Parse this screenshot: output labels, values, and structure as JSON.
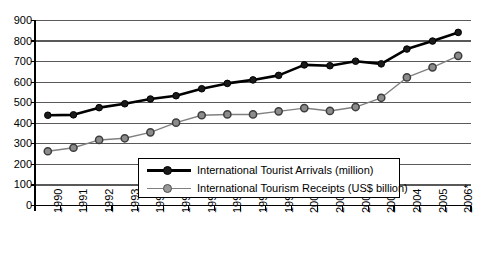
{
  "chart_data": {
    "type": "line",
    "title": "",
    "subtitle": "",
    "xlabel": "",
    "ylabel": "",
    "categories": [
      "1990",
      "1991",
      "1992",
      "1993",
      "1994",
      "1995",
      "1996",
      "1997",
      "1998",
      "1999",
      "2000",
      "2001",
      "2002",
      "2003",
      "2004",
      "2005",
      "2006*"
    ],
    "ylim": [
      0,
      900
    ],
    "yticks": [
      0,
      100,
      200,
      300,
      400,
      500,
      600,
      700,
      800,
      900
    ],
    "grid": "horizontal",
    "legend_position": "inside-bottom-center",
    "series": [
      {
        "name": "International Tourist Arrivals (million)",
        "color": "#000000",
        "marker": "filled-circle",
        "marker_fill": "#1a1a1a",
        "values": [
          439,
          441,
          476,
          495,
          518,
          534,
          568,
          594,
          611,
          633,
          684,
          680,
          702,
          689,
          761,
          800,
          842
        ]
      },
      {
        "name": "International Tourism Receipts (US$ billion)",
        "color": "#808080",
        "marker": "open-circle",
        "marker_fill": "#8c8c8c",
        "values": [
          264,
          281,
          319,
          327,
          356,
          403,
          439,
          443,
          443,
          458,
          474,
          460,
          479,
          524,
          623,
          672,
          728
        ]
      }
    ],
    "annotations": [
      {
        "text": "*",
        "meaning": "2006 value is provisional"
      }
    ]
  },
  "colors": {
    "axis": "#000000",
    "gridline": "#595959",
    "series_arrivals": "#000000",
    "series_receipts": "#808080",
    "background": "#ffffff"
  },
  "legend": {
    "items": [
      {
        "label": "International Tourist Arrivals (million)"
      },
      {
        "label": "International Tourism Receipts (US$ billion)"
      }
    ]
  },
  "axes": {
    "y": {
      "labels": [
        "900",
        "800",
        "700",
        "600",
        "500",
        "400",
        "300",
        "200",
        "100",
        "0"
      ]
    },
    "x": {
      "labels": [
        "1990",
        "1991",
        "1992",
        "1993",
        "1994",
        "1995",
        "1996",
        "1997",
        "1998",
        "1999",
        "2000",
        "2001",
        "2002",
        "2003",
        "2004",
        "2005",
        "2006*"
      ]
    }
  }
}
